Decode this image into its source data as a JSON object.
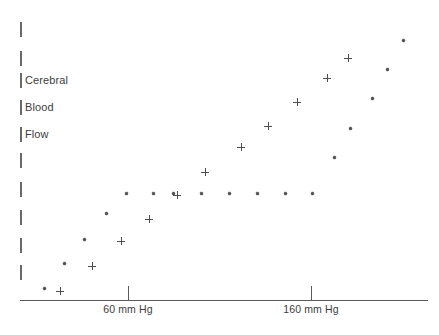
{
  "chart_data": {
    "type": "scatter",
    "title": "",
    "xlabel": "",
    "ylabel": "Cerebral Blood Flow",
    "ylabel_words": [
      "Cerebral",
      "Blood",
      "Flow"
    ],
    "grid": false,
    "legend": "none",
    "axis": {
      "x_ticks": [
        {
          "label": "60 mm Hg",
          "px": 128
        },
        {
          "label": "160 mm Hg",
          "px": 311
        }
      ],
      "x_range_px": [
        20,
        428
      ],
      "y_tick_count": 10,
      "y_ticks_px": [
        22,
        51,
        73,
        100,
        127,
        153,
        182,
        210,
        238,
        265
      ],
      "y_baseline_px": 300
    },
    "series": [
      {
        "name": "dot-series",
        "marker": "dot",
        "color": "#4e4e4e",
        "points": [
          {
            "x": 44,
            "y": 288
          },
          {
            "x": 64,
            "y": 263
          },
          {
            "x": 84,
            "y": 239
          },
          {
            "x": 106,
            "y": 213
          },
          {
            "x": 126,
            "y": 193
          },
          {
            "x": 153,
            "y": 193
          },
          {
            "x": 173,
            "y": 193
          },
          {
            "x": 201,
            "y": 193
          },
          {
            "x": 229,
            "y": 193
          },
          {
            "x": 257,
            "y": 193
          },
          {
            "x": 285,
            "y": 193
          },
          {
            "x": 312,
            "y": 193
          },
          {
            "x": 334,
            "y": 157
          },
          {
            "x": 350,
            "y": 128
          },
          {
            "x": 372,
            "y": 98
          },
          {
            "x": 387,
            "y": 69
          },
          {
            "x": 403,
            "y": 40
          }
        ]
      },
      {
        "name": "plus-series",
        "marker": "plus",
        "color": "#4e4e4e",
        "points": [
          {
            "x": 60,
            "y": 291
          },
          {
            "x": 92,
            "y": 266
          },
          {
            "x": 121,
            "y": 241
          },
          {
            "x": 149,
            "y": 219
          },
          {
            "x": 177,
            "y": 195
          },
          {
            "x": 205,
            "y": 172
          },
          {
            "x": 241,
            "y": 147
          },
          {
            "x": 268,
            "y": 126
          },
          {
            "x": 297,
            "y": 102
          },
          {
            "x": 327,
            "y": 78
          },
          {
            "x": 348,
            "y": 58
          }
        ]
      }
    ]
  },
  "colors": {
    "axis": "#5b5b5b",
    "marker": "#4e4e4e",
    "text": "#3d3d3d",
    "background": "#ffffff"
  }
}
